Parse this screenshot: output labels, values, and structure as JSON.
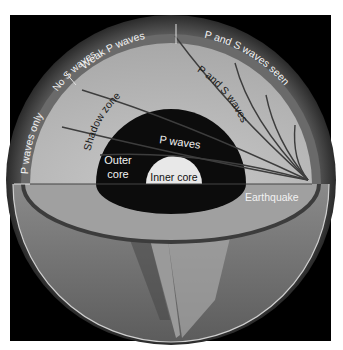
{
  "diagram": {
    "labels": {
      "p_waves_only": "P waves only",
      "no_s_waves": "No S waves",
      "weak_p_waves": "Weak P waves",
      "p_and_s_waves_seen": "P and S waves seen",
      "shadow_zone": "Shadow zone",
      "p_and_s_waves": "P and S waves",
      "p_waves": "P waves",
      "outer_core_line1": "Outer",
      "outer_core_line2": "core",
      "inner_core": "Inner core",
      "earthquake": "Earthquake"
    },
    "colors": {
      "background": "#000000",
      "mantle": "#b8b8b8",
      "crust_ring": "#6e6e6e",
      "outer_core": "#0c0c0c",
      "inner_core": "#e8e8e8",
      "lower_hemisphere": "#7a7a7a",
      "wave_lines": "#4a4a4a",
      "text": "#f2f2f2"
    }
  }
}
